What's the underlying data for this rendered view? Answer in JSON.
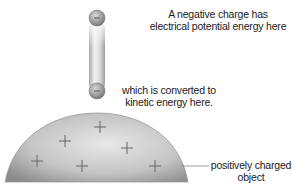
{
  "diagram": {
    "labels": {
      "top_line1": "A negative charge has",
      "top_line2": "electrical potential energy here",
      "mid_line1": "which is converted to",
      "mid_line2": "kinetic energy here.",
      "object_line1": "positively charged",
      "object_line2": "object"
    },
    "charges": {
      "negative_symbol": "−",
      "positive_symbol": "+",
      "positive_count": 6
    },
    "colors": {
      "dome_light": "#e6e6e6",
      "dome_dark": "#8e8e8e",
      "sphere": "#9a9a9a",
      "tube": "#cfcfcf",
      "plus": "#6f6f6f",
      "text": "#1a1a1a"
    }
  }
}
